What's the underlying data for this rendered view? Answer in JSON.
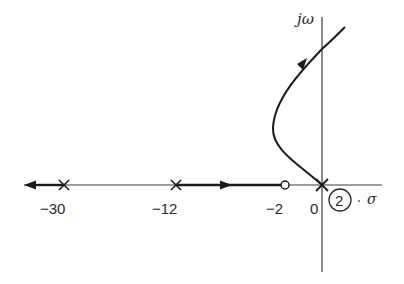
{
  "diagram": {
    "type": "root-locus",
    "axes": {
      "real_axis_label": "σ",
      "imag_axis_label": "jω"
    },
    "poles": [
      {
        "value": -30,
        "label": "−30"
      },
      {
        "value": -12,
        "label": "−12"
      },
      {
        "value": 0,
        "label": "0",
        "multiplicity_label": "2"
      }
    ],
    "zeros": [
      {
        "value": -2,
        "label": "−2"
      }
    ],
    "colors": {
      "line": "#1a1a1a",
      "background": "#ffffff"
    }
  }
}
